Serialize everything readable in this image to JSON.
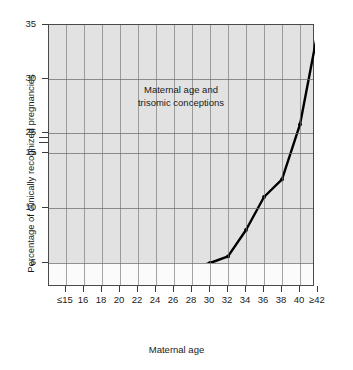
{
  "chart_data": {
    "type": "line",
    "title": "",
    "annotation_lines": [
      "Maternal age and",
      "trisomic conceptions"
    ],
    "xlabel": "Maternal age",
    "ylabel": "Percentage of clinically recognized pregnancies",
    "categories": [
      "≤15",
      "16",
      "18",
      "20",
      "22",
      "24",
      "26",
      "28",
      "30",
      "32",
      "34",
      "36",
      "38",
      "40",
      "≥42"
    ],
    "values": [
      3.1,
      1.8,
      1.9,
      2.3,
      3.1,
      2.8,
      4.1,
      4.1,
      5.0,
      5.6,
      8.0,
      11.0,
      12.6,
      25.8,
      34.5
    ],
    "yticks": [
      "5",
      "10",
      "15",
      "25",
      "30",
      "35"
    ],
    "ylim": [
      0,
      35
    ],
    "axis_break": {
      "between": [
        "15",
        "25"
      ],
      "present": true
    },
    "grid": true,
    "legend": "none",
    "series": [
      {
        "name": "Trisomic conceptions",
        "values": [
          3.1,
          1.8,
          1.9,
          2.3,
          3.1,
          2.8,
          4.1,
          4.1,
          5.0,
          5.6,
          8.0,
          11.0,
          12.6,
          25.8,
          34.5
        ]
      }
    ],
    "line_color": "#000000",
    "plot_background": "#e2e2e2",
    "marker": "dot"
  }
}
